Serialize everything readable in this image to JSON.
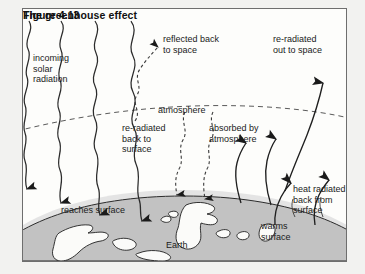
{
  "figure": {
    "caption_number": "Figure 4.13",
    "caption_title": "The greenhouse effect",
    "background_color": "#f2f2f0",
    "panel_color": "#fdfdfb",
    "border_color": "#6e6e6e",
    "ink_color": "#1a1a1a",
    "earth_fill": "#bdbdbd",
    "earth_halo": "#dedede"
  },
  "labels": {
    "incoming_solar": "incoming\nsolar\nradiation",
    "reflected_back": "reflected back\nto space",
    "reradiated_out": "re-radiated\nout to space",
    "atmosphere": "atmosphere",
    "reradiated_surface": "re-radiated\nback to\nsurface",
    "absorbed_by": "absorbed by\natmosphere",
    "heat_radiated": "heat radiated\nback from\nsurface",
    "reaches_surface": "reaches surface",
    "warms_surface": "warms\nsurface",
    "earth": "Earth"
  },
  "diagram": {
    "type": "schematic",
    "flows": [
      {
        "name": "incoming-solar-radiation",
        "style": "wavy-solid",
        "direction": "down",
        "count": 4
      },
      {
        "name": "reflected-back-to-space",
        "style": "wavy-dashed",
        "direction": "up",
        "count": 1
      },
      {
        "name": "re-radiated-back-to-surface",
        "style": "wavy-dashed",
        "direction": "down",
        "count": 2
      },
      {
        "name": "absorbed-by-atmosphere",
        "style": "curved-solid",
        "direction": "up",
        "count": 2
      },
      {
        "name": "heat-radiated-back-from-surface",
        "style": "curved-solid",
        "direction": "up",
        "count": 2
      },
      {
        "name": "re-radiated-out-to-space",
        "style": "curved-solid",
        "direction": "up",
        "count": 1
      }
    ],
    "atmosphere_boundary": "dashed-arc",
    "earth_surface": "solid-arc"
  }
}
